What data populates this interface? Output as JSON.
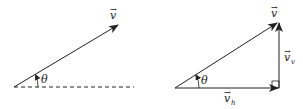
{
  "diagram": {
    "colors": {
      "line": "#222222",
      "background": "#ffffff"
    },
    "left_figure": {
      "vector_label": "v",
      "angle_label": "θ",
      "baseline_style": "dashed"
    },
    "right_figure": {
      "vector_label": "v",
      "angle_label": "θ",
      "vertical_component_label": "v",
      "vertical_component_subscript": "v",
      "horizontal_component_label": "v",
      "horizontal_component_subscript": "h",
      "right_angle_marker": true
    }
  }
}
